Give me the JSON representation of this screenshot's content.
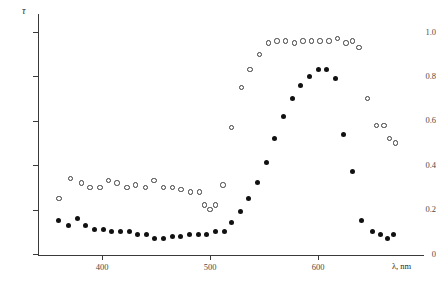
{
  "chart_data": {
    "type": "scatter",
    "title": "",
    "xlabel": "λ, nm",
    "ylabel": "τ",
    "xlim": [
      355,
      675
    ],
    "ylim": [
      0,
      1.05
    ],
    "xticks": [
      400,
      500,
      600
    ],
    "xtick_labels": [
      "400",
      "500",
      "600"
    ],
    "yticks": [
      0,
      0.2,
      0.4,
      0.6,
      0.8,
      1.0
    ],
    "ytick_labels": [
      "0",
      "0.2",
      "0.4",
      "0.6",
      "0.8",
      "1.0"
    ],
    "grid": false,
    "legend": "none",
    "series": [
      {
        "name": "open-circles",
        "marker": "open-circle",
        "color": "#3c3c3c",
        "points": [
          [
            360,
            0.25
          ],
          [
            371,
            0.34
          ],
          [
            381,
            0.32
          ],
          [
            389,
            0.3
          ],
          [
            398,
            0.3
          ],
          [
            406,
            0.33
          ],
          [
            414,
            0.32
          ],
          [
            423,
            0.3
          ],
          [
            431,
            0.31
          ],
          [
            440,
            0.3
          ],
          [
            448,
            0.33
          ],
          [
            457,
            0.3
          ],
          [
            465,
            0.3
          ],
          [
            473,
            0.29
          ],
          [
            482,
            0.28
          ],
          [
            490,
            0.28
          ],
          [
            495,
            0.22
          ],
          [
            500,
            0.2
          ],
          [
            505,
            0.22
          ],
          [
            512,
            0.31
          ],
          [
            520,
            0.57
          ],
          [
            529,
            0.75
          ],
          [
            537,
            0.83
          ],
          [
            546,
            0.9
          ],
          [
            554,
            0.95
          ],
          [
            562,
            0.96
          ],
          [
            570,
            0.96
          ],
          [
            578,
            0.95
          ],
          [
            586,
            0.96
          ],
          [
            594,
            0.96
          ],
          [
            602,
            0.96
          ],
          [
            610,
            0.96
          ],
          [
            618,
            0.97
          ],
          [
            626,
            0.95
          ],
          [
            632,
            0.96
          ],
          [
            638,
            0.93
          ],
          [
            646,
            0.7
          ],
          [
            654,
            0.58
          ],
          [
            661,
            0.58
          ],
          [
            666,
            0.52
          ],
          [
            672,
            0.5
          ]
        ]
      },
      {
        "name": "filled-circles",
        "marker": "filled-circle",
        "color": "#111111",
        "points": [
          [
            360,
            0.15
          ],
          [
            369,
            0.13
          ],
          [
            377,
            0.16
          ],
          [
            385,
            0.13
          ],
          [
            393,
            0.11
          ],
          [
            401,
            0.11
          ],
          [
            409,
            0.1
          ],
          [
            417,
            0.1
          ],
          [
            425,
            0.1
          ],
          [
            433,
            0.09
          ],
          [
            441,
            0.09
          ],
          [
            449,
            0.07
          ],
          [
            457,
            0.07
          ],
          [
            465,
            0.08
          ],
          [
            473,
            0.08
          ],
          [
            481,
            0.09
          ],
          [
            489,
            0.09
          ],
          [
            497,
            0.09
          ],
          [
            505,
            0.1
          ],
          [
            513,
            0.1
          ],
          [
            520,
            0.14
          ],
          [
            528,
            0.19
          ],
          [
            536,
            0.25
          ],
          [
            544,
            0.32
          ],
          [
            552,
            0.41
          ],
          [
            560,
            0.52
          ],
          [
            568,
            0.62
          ],
          [
            576,
            0.7
          ],
          [
            584,
            0.76
          ],
          [
            592,
            0.8
          ],
          [
            600,
            0.83
          ],
          [
            608,
            0.83
          ],
          [
            616,
            0.79
          ],
          [
            624,
            0.54
          ],
          [
            632,
            0.37
          ],
          [
            640,
            0.15
          ],
          [
            650,
            0.1
          ],
          [
            658,
            0.09
          ],
          [
            664,
            0.07
          ],
          [
            670,
            0.09
          ]
        ]
      }
    ]
  },
  "geometry": {
    "origin_x_px": 38,
    "origin_y_px": 255,
    "x_400_px": 102,
    "x_500_px": 233,
    "x_600_px": 318,
    "y_0_px": 254,
    "y_1_px": 32
  }
}
